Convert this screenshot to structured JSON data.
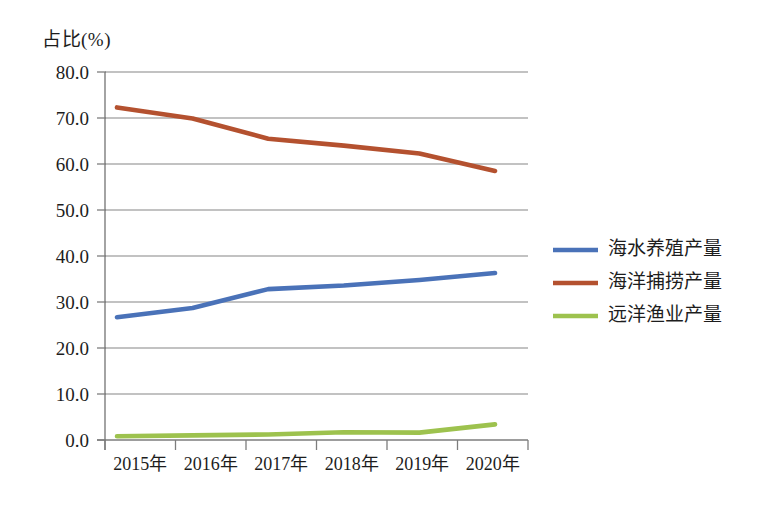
{
  "chart_data": {
    "type": "line",
    "title": "",
    "ylabel": "占比(%)",
    "xlabel": "",
    "categories": [
      "2015年",
      "2016年",
      "2017年",
      "2018年",
      "2019年",
      "2020年"
    ],
    "ylim": [
      0.0,
      80.0
    ],
    "ytick_labels": [
      "0.0",
      "10.0",
      "20.0",
      "30.0",
      "40.0",
      "50.0",
      "60.0",
      "70.0",
      "80.0"
    ],
    "ytick_values": [
      0.0,
      10.0,
      20.0,
      30.0,
      40.0,
      50.0,
      60.0,
      70.0,
      80.0
    ],
    "grid": true,
    "legend_position": "right",
    "series": [
      {
        "name": "海水养殖产量",
        "color": "#4a72b8",
        "values": [
          26.7,
          28.7,
          32.8,
          33.6,
          34.8,
          36.3
        ]
      },
      {
        "name": "海洋捕捞产量",
        "color": "#b4512f",
        "values": [
          72.3,
          69.9,
          65.5,
          64.0,
          62.3,
          58.5
        ]
      },
      {
        "name": "远洋渔业产量",
        "color": "#9dc24e",
        "values": [
          0.8,
          1.0,
          1.2,
          1.7,
          1.6,
          3.4
        ]
      }
    ]
  }
}
